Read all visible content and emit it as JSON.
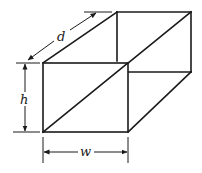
{
  "diagram": {
    "colors": {
      "stroke": "#1a1a1a",
      "background": "#ffffff"
    },
    "labels": {
      "depth": "d",
      "height": "h",
      "width": "w"
    },
    "front_face": {
      "top_left": [
        43,
        63
      ],
      "top_right": [
        128,
        63
      ],
      "bottom_right": [
        128,
        132
      ],
      "bottom_left": [
        43,
        132
      ]
    },
    "back_face": {
      "top_left": [
        117,
        12
      ],
      "top_right": [
        191,
        12
      ],
      "bottom_right": [
        191,
        72
      ],
      "bottom_left": [
        117,
        72
      ]
    },
    "diagonals": [
      {
        "name": "front-face-diagonal",
        "from": [
          43,
          132
        ],
        "to": [
          128,
          63
        ]
      },
      {
        "name": "back-face-diagonal",
        "from": [
          128,
          63
        ],
        "to": [
          191,
          12
        ]
      }
    ]
  }
}
